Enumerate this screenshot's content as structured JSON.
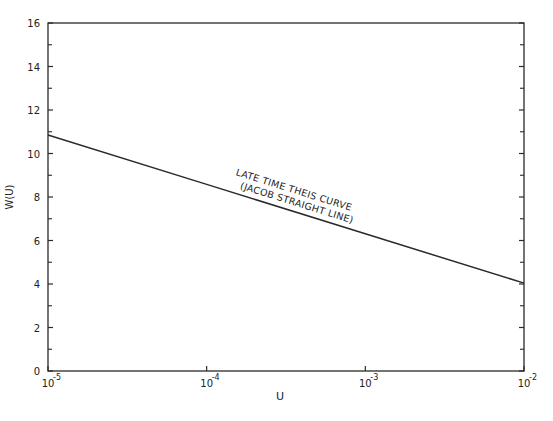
{
  "chart_data": {
    "type": "line",
    "title": "",
    "xlabel": "U",
    "ylabel": "W(U)",
    "xscale": "log",
    "xlim": [
      1e-05,
      0.01
    ],
    "ylim": [
      0,
      16
    ],
    "grid": false,
    "legend": null,
    "x_ticks": [
      {
        "value": 1e-05,
        "base": "10",
        "exp": "-5"
      },
      {
        "value": 0.0001,
        "base": "10",
        "exp": "-4"
      },
      {
        "value": 0.001,
        "base": "10",
        "exp": "-3"
      },
      {
        "value": 0.01,
        "base": "10",
        "exp": "-2"
      }
    ],
    "y_ticks": [
      0,
      2,
      4,
      6,
      8,
      10,
      12,
      14,
      16
    ],
    "y_minor_ticks": [
      1,
      3,
      5,
      7,
      9,
      11,
      13,
      15
    ],
    "series": [
      {
        "name": "Late time Theis curve (Jacob straight line)",
        "x": [
          1e-05,
          0.0001,
          0.001,
          0.01
        ],
        "y": [
          10.85,
          8.58,
          6.31,
          4.04
        ]
      }
    ],
    "annotations": [
      {
        "text": "LATE TIME THEIS CURVE",
        "x": 0.0003,
        "y": 7.7
      },
      {
        "text": "(JACOB STRAIGHT LINE)",
        "x": 0.0003,
        "y": 7.0
      }
    ]
  }
}
